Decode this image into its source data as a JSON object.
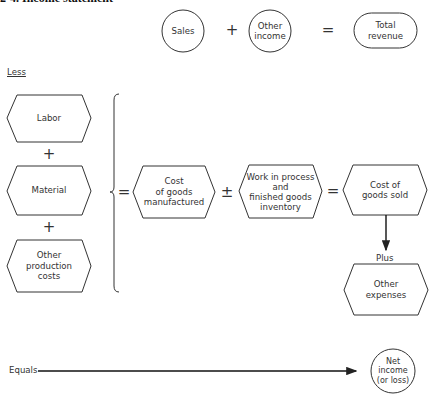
{
  "title": "2-4.  Income statement",
  "revenue_row": {
    "sales": "Sales",
    "plus": "+",
    "other_income": "Other\nincome",
    "equals": "=",
    "total_revenue": "Total\nrevenue"
  },
  "less_label": "Less",
  "production_costs": {
    "labor": "Labor",
    "plus1": "+",
    "material": "Material",
    "plus2": "+",
    "other_production_costs": "Other\nproduction\ncosts"
  },
  "cost_row": {
    "equals1": "=",
    "cost_of_goods_manufactured": "Cost\nof goods\nmanufactured",
    "plus_minus": "±",
    "inventory": "Work in process\nand\nfinished goods\ninventory",
    "equals2": "=",
    "cost_of_goods_sold": "Cost of\ngoods sold"
  },
  "plus_label": "Plus",
  "other_expenses": "Other\nexpenses",
  "equals_label": "Equals",
  "net_income": "Net\nincome\n(or loss)",
  "colors": {
    "stroke": "#333333",
    "text": "#333333",
    "background": "#ffffff"
  }
}
